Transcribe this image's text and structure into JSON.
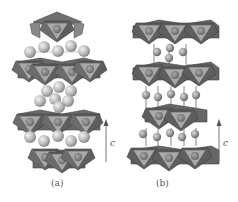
{
  "figure": {
    "panels": [
      {
        "id": "a",
        "label": "(a)",
        "axis_label": "c",
        "description": "layered structure with octahedral layers separated by close-packed sphere layers"
      },
      {
        "id": "b",
        "label": "(b)",
        "axis_label": "c",
        "description": "layered structure with octahedral layers connected by spheres on vertical rods"
      }
    ],
    "colors": {
      "octahedron_dark": "#5a5a5a",
      "octahedron_mid": "#8a8a8a",
      "octahedron_light": "#b5b5b5",
      "center_atom": "#7d7d7d",
      "sphere": "#c8c8c8",
      "arrow": "#777777"
    }
  }
}
